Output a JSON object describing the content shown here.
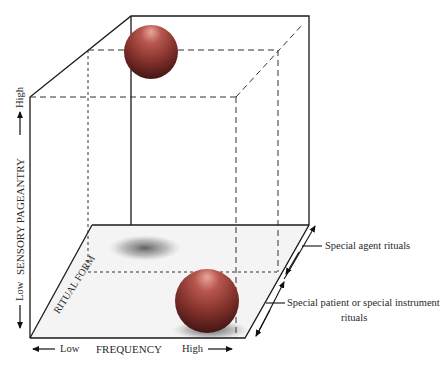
{
  "diagram": {
    "type": "3d-cube-space",
    "axes": {
      "y": {
        "title": "SENSORY PAGEANTRY",
        "low": "Low",
        "high": "High"
      },
      "x": {
        "title": "FREQUENCY",
        "low": "Low",
        "high": "High"
      },
      "z": {
        "title": "RITUAL FORM"
      }
    },
    "annotations": [
      {
        "id": "agent",
        "text": "Special agent rituals"
      },
      {
        "id": "patient",
        "line1": "Special patient or special instrument",
        "line2": "rituals"
      }
    ],
    "spheres": [
      {
        "id": "top",
        "position": "high pageantry, low frequency, special agent"
      },
      {
        "id": "bottom",
        "position": "low pageantry, high frequency, special patient/instrument"
      }
    ],
    "colors": {
      "line": "#1a1a1a",
      "sphere_light": "#d8837a",
      "sphere_dark": "#5a1f1c",
      "shadow": "#3a3a3a"
    }
  }
}
